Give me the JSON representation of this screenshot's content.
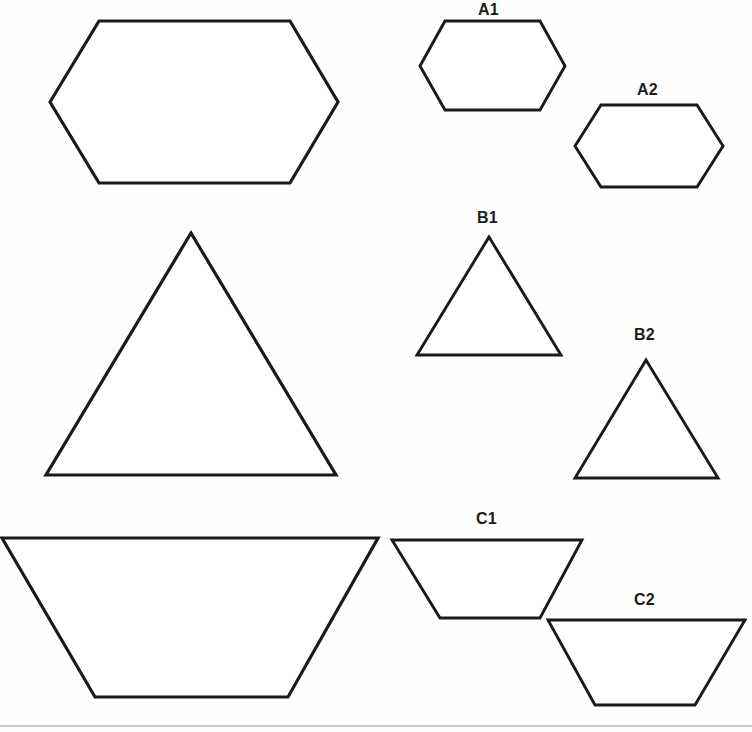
{
  "page": {
    "width": 752,
    "height": 732,
    "background_color": "#fefefe",
    "stroke_color": "#1a1a1a",
    "fill_color": "#ffffff",
    "rule_color": "#b9b9b9"
  },
  "labels": {
    "a1": "A1",
    "a2": "A2",
    "b1": "B1",
    "b2": "B2",
    "c1": "C1",
    "c2": "C2"
  },
  "figures": {
    "hexagon_large": {
      "name": "large-hexagon",
      "type": "hexagon",
      "label": "",
      "points": "50,102 99,21 290,21 338,102 290,183 99,183"
    },
    "hexagon_a1": {
      "name": "hexagon-a1",
      "type": "hexagon",
      "label": "A1",
      "points": "420,66 445,21 540,21 565,66 540,110 445,110"
    },
    "hexagon_a2": {
      "name": "hexagon-a2",
      "type": "hexagon",
      "label": "A2",
      "points": "575,146 601,105 697,105 723,146 697,187 601,187"
    },
    "triangle_large": {
      "name": "large-triangle",
      "type": "triangle",
      "label": "",
      "points": "191,233 336,475 46,475"
    },
    "triangle_b1": {
      "name": "triangle-b1",
      "type": "triangle",
      "label": "B1",
      "points": "489,237 561,355 417,355"
    },
    "triangle_b2": {
      "name": "triangle-b2",
      "type": "triangle",
      "label": "B2",
      "points": "646,360 718,478 575,478"
    },
    "trapezoid_large": {
      "name": "large-trapezoid",
      "type": "trapezoid",
      "label": "",
      "points": "2,538 378,538 288,697 95,697"
    },
    "trapezoid_c1": {
      "name": "trapezoid-c1",
      "type": "trapezoid",
      "label": "C1",
      "points": "392,540 582,540 540,618 440,618"
    },
    "trapezoid_c2": {
      "name": "trapezoid-c2",
      "type": "trapezoid",
      "label": "C2",
      "points": "548,620 745,620 695,705 595,705"
    },
    "baseline_rule": {
      "name": "bottom-rule",
      "type": "line",
      "x1": 0,
      "y1": 726,
      "x2": 752,
      "y2": 726
    }
  },
  "label_positions": {
    "a1": {
      "left": 478,
      "top": 2
    },
    "a2": {
      "left": 637,
      "top": 82
    },
    "b1": {
      "left": 477,
      "top": 210
    },
    "b2": {
      "left": 634,
      "top": 327
    },
    "c1": {
      "left": 476,
      "top": 511
    },
    "c2": {
      "left": 634,
      "top": 592
    }
  }
}
